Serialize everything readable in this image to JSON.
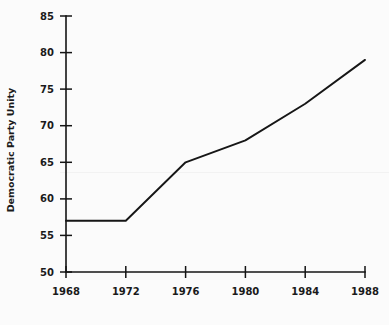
{
  "chart_data": {
    "type": "line",
    "title": "",
    "xlabel": "",
    "ylabel": "Democratic Party Unity",
    "x": [
      1968,
      1972,
      1976,
      1980,
      1984,
      1988
    ],
    "categories": [
      "1968",
      "1972",
      "1976",
      "1980",
      "1984",
      "1988"
    ],
    "values": [
      57,
      57,
      65,
      68,
      73,
      79
    ],
    "series": [
      {
        "name": "Democratic Party Unity",
        "values": [
          57,
          57,
          65,
          68,
          73,
          79
        ]
      }
    ],
    "xlim": [
      1968,
      1988
    ],
    "ylim": [
      50,
      85
    ],
    "xticks": [
      1968,
      1972,
      1976,
      1980,
      1984,
      1988
    ],
    "yticks": [
      50,
      55,
      60,
      65,
      70,
      75,
      80,
      85
    ],
    "xtick_labels": [
      "1968",
      "1972",
      "1976",
      "1980",
      "1984",
      "1988"
    ],
    "ytick_labels": [
      "50",
      "55",
      "60",
      "65",
      "70",
      "75",
      "80",
      "85"
    ],
    "grid": false,
    "legend": "none",
    "line_color": "#161616",
    "background_color": "#fbfbfb"
  },
  "axes": {
    "y_title": "Democratic Party Unity",
    "y_ticks": [
      {
        "label": "85",
        "value": 85
      },
      {
        "label": "80",
        "value": 80
      },
      {
        "label": "75",
        "value": 75
      },
      {
        "label": "70",
        "value": 70
      },
      {
        "label": "65",
        "value": 65
      },
      {
        "label": "60",
        "value": 60
      },
      {
        "label": "55",
        "value": 55
      },
      {
        "label": "50",
        "value": 50
      }
    ],
    "x_ticks": [
      {
        "label": "1968",
        "value": 1968
      },
      {
        "label": "1972",
        "value": 1972
      },
      {
        "label": "1976",
        "value": 1976
      },
      {
        "label": "1980",
        "value": 1980
      },
      {
        "label": "1984",
        "value": 1984
      },
      {
        "label": "1988",
        "value": 1988
      }
    ]
  }
}
